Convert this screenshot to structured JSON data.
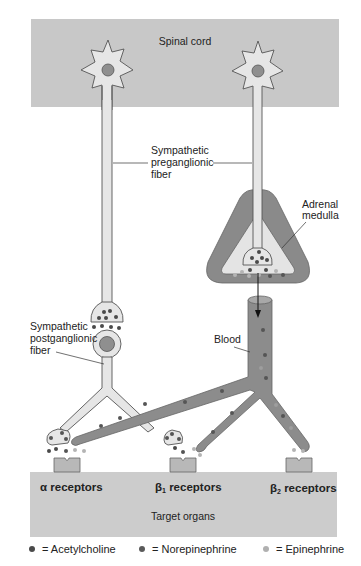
{
  "diagram": {
    "regions": {
      "top": "Spinal cord",
      "bottom": "Target organs"
    },
    "labels": {
      "preganglionic": [
        "Sympathetic",
        "preganglionic",
        "fiber"
      ],
      "postganglionic": [
        "Sympathetic",
        "postganglionic",
        "fiber"
      ],
      "adrenal": [
        "Adrenal",
        "medulla"
      ],
      "blood": "Blood"
    },
    "receptors": [
      {
        "greek": "α",
        "sub": "",
        "text": " receptors"
      },
      {
        "greek": "β",
        "sub": "1",
        "text": " receptors"
      },
      {
        "greek": "β",
        "sub": "2",
        "text": " receptors"
      }
    ]
  },
  "legend": [
    {
      "symbol": "•",
      "label": "= Acetylcholine",
      "color": "#4a4a4a"
    },
    {
      "symbol": "•",
      "label": "= Norepinephrine",
      "color": "#5a5a5a"
    },
    {
      "symbol": "•",
      "label": "= Epinephrine",
      "color": "#b0b0b0"
    }
  ],
  "colors": {
    "region_fill": "#c8c8c8",
    "neuron_fill": "#e6e6e6",
    "vessel_fill": "#8c8c8c",
    "adrenal_outer": "#8a8a8a",
    "nucleus": "#8f8f8f",
    "ach_dot": "#4a4a4a",
    "ne_dot": "#555555",
    "epi_dot": "#b4b4b4"
  }
}
